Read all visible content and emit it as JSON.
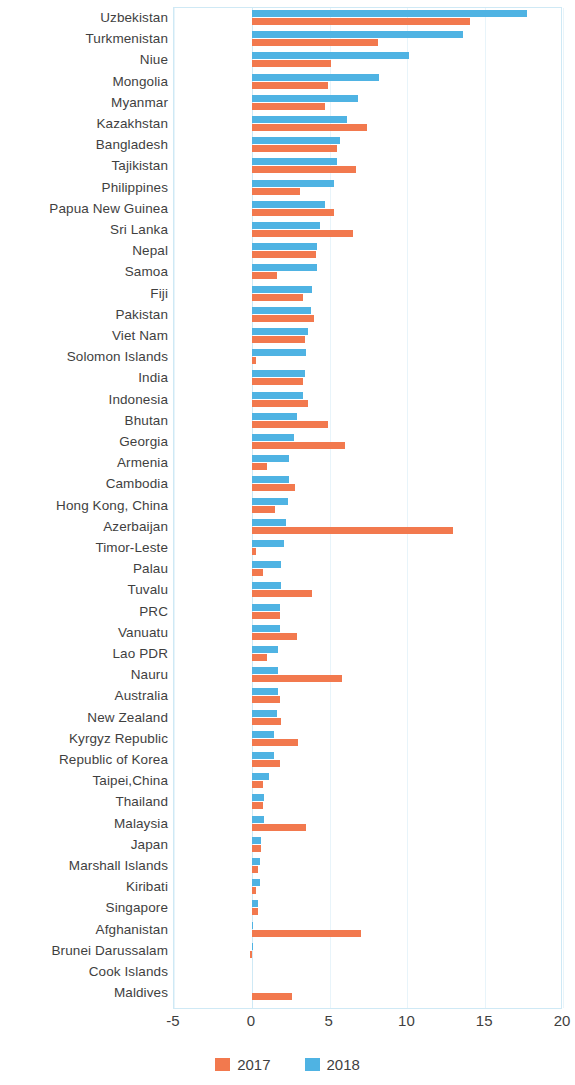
{
  "chart": {
    "type": "bar",
    "orientation": "horizontal",
    "title": "",
    "xlabel": "",
    "ylabel": ""
  },
  "axis": {
    "ticks": [
      "-5",
      "0",
      "5",
      "10",
      "15",
      "20"
    ],
    "tick_values": [
      -5,
      0,
      5,
      10,
      15,
      20
    ],
    "xlim": [
      -5,
      20
    ]
  },
  "legend": {
    "items": [
      {
        "label": "2017",
        "color": "#f2794e"
      },
      {
        "label": "2018",
        "color": "#4fb3e3"
      }
    ]
  },
  "colors": {
    "series_2017": "#f2794e",
    "series_2018": "#4fb3e3",
    "frame": "#cfe9f5",
    "grid": "#e8f4fa",
    "text": "#3f3f3f"
  },
  "chart_data": {
    "type": "bar",
    "title": "",
    "xlabel": "",
    "ylabel": "",
    "xlim": [
      -5,
      20
    ],
    "grid": true,
    "legend_position": "bottom",
    "categories": [
      "Uzbekistan",
      "Turkmenistan",
      "Niue",
      "Mongolia",
      "Myanmar",
      "Kazakhstan",
      "Bangladesh",
      "Tajikistan",
      "Philippines",
      "Papua New Guinea",
      "Sri Lanka",
      "Nepal",
      "Samoa",
      "Fiji",
      "Pakistan",
      "Viet Nam",
      "Solomon Islands",
      "India",
      "Indonesia",
      "Bhutan",
      "Georgia",
      "Armenia",
      "Cambodia",
      "Hong Kong, China",
      "Azerbaijan",
      "Timor-Leste",
      "Palau",
      "Tuvalu",
      "PRC",
      "Vanuatu",
      "Lao PDR",
      "Nauru",
      "Australia",
      "New Zealand",
      "Kyrgyz Republic",
      "Republic of Korea",
      "Taipei,China",
      "Thailand",
      "Malaysia",
      "Japan",
      "Marshall Islands",
      "Kiribati",
      "Singapore",
      "Afghanistan",
      "Brunei Darussalam",
      "Cook Islands",
      "Maldives"
    ],
    "series": [
      {
        "name": "2017",
        "color": "#f2794e",
        "values": [
          14.0,
          8.1,
          5.1,
          4.9,
          4.7,
          7.4,
          5.5,
          6.7,
          3.1,
          5.3,
          6.5,
          4.1,
          1.6,
          3.3,
          4.0,
          3.4,
          0.3,
          3.3,
          3.6,
          4.9,
          6.0,
          1.0,
          2.8,
          1.5,
          12.9,
          0.3,
          0.7,
          3.9,
          1.8,
          2.9,
          1.0,
          5.8,
          1.8,
          1.9,
          3.0,
          1.8,
          0.7,
          0.7,
          3.5,
          0.6,
          0.4,
          0.3,
          0.4,
          7.0,
          -0.1,
          0.0,
          2.6
        ]
      },
      {
        "name": "2018",
        "color": "#4fb3e3",
        "values": [
          17.7,
          13.6,
          10.1,
          8.2,
          6.8,
          6.1,
          5.7,
          5.5,
          5.3,
          4.7,
          4.4,
          4.2,
          4.2,
          3.9,
          3.8,
          3.6,
          3.5,
          3.4,
          3.3,
          2.9,
          2.7,
          2.4,
          2.4,
          2.3,
          2.2,
          2.1,
          1.9,
          1.9,
          1.8,
          1.8,
          1.7,
          1.7,
          1.7,
          1.6,
          1.4,
          1.4,
          1.1,
          0.8,
          0.8,
          0.6,
          0.5,
          0.5,
          0.4,
          0.1,
          0.05,
          0.0,
          0.0
        ]
      }
    ]
  }
}
